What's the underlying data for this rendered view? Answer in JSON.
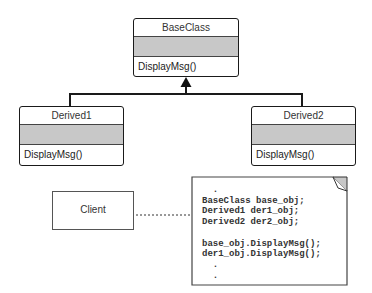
{
  "diagram": {
    "type": "uml-class-diagram",
    "colors": {
      "border": "#1a1a1a",
      "attribute_fill": "#c8c8c8",
      "text": "#333333",
      "note_corner_fill": "#c8c8c8"
    },
    "classes": [
      {
        "id": "baseclass",
        "name": "BaseClass",
        "attributes": [],
        "methods": [
          "DisplayMsg()"
        ]
      },
      {
        "id": "derived1",
        "name": "Derived1",
        "attributes": [],
        "methods": [
          "DisplayMsg()"
        ]
      },
      {
        "id": "derived2",
        "name": "Derived2",
        "attributes": [],
        "methods": [
          "DisplayMsg()"
        ]
      }
    ],
    "client": {
      "name": "Client"
    },
    "relationships": [
      {
        "type": "generalization",
        "from": "Derived1",
        "to": "BaseClass"
      },
      {
        "type": "generalization",
        "from": "Derived2",
        "to": "BaseClass"
      },
      {
        "type": "note-attachment",
        "from": "Client",
        "to": "note"
      }
    ],
    "note": {
      "lines": [
        ".",
        "BaseClass base_obj;",
        "Derived1 der1_obj;",
        "Derived2 der2_obj;",
        "",
        "base_obj.DisplayMsg();",
        "der1_obj.DisplayMsg();",
        "  .",
        "  ."
      ],
      "text": "  .\nBaseClass base_obj;\nDerived1 der1_obj;\nDerived2 der2_obj;\n\nbase_obj.DisplayMsg();\nder1_obj.DisplayMsg();\n  .\n  ."
    }
  }
}
